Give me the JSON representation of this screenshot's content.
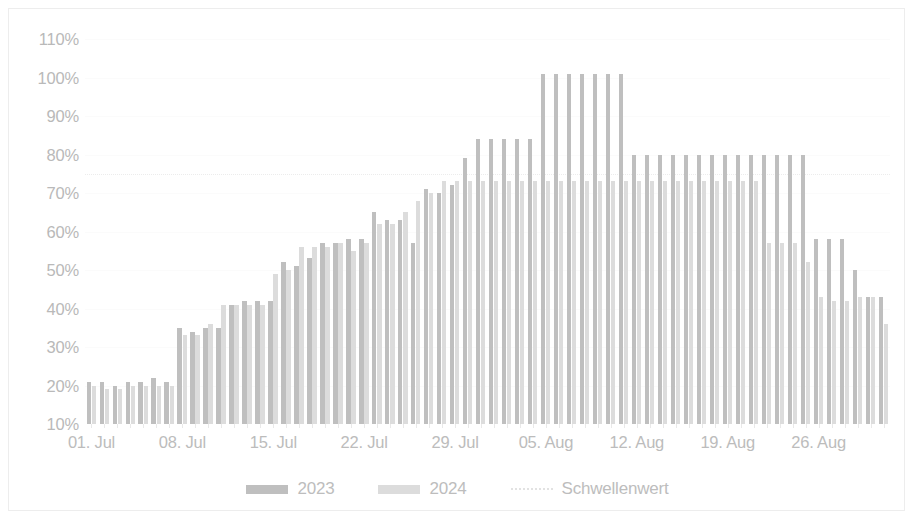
{
  "chart_data": {
    "type": "bar",
    "title": "",
    "subtitle": "",
    "xlabel": "",
    "ylabel": "",
    "ylim": [
      10,
      110
    ],
    "ytick_labels": [
      "110%",
      "100%",
      "90%",
      "80%",
      "70%",
      "60%",
      "50%",
      "40%",
      "30%",
      "20%",
      "10%"
    ],
    "ytick_values": [
      110,
      100,
      90,
      80,
      70,
      60,
      50,
      40,
      30,
      20,
      10
    ],
    "xtick_labels": [
      "01. Jul",
      "08. Jul",
      "15. Jul",
      "22. Jul",
      "29. Jul",
      "05. Aug",
      "12. Aug",
      "19. Aug",
      "26. Aug"
    ],
    "xtick_indices": [
      0,
      7,
      14,
      21,
      28,
      35,
      42,
      49,
      56
    ],
    "grid": true,
    "legend_position": "bottom",
    "x": [
      "01. Jul",
      "02. Jul",
      "03. Jul",
      "04. Jul",
      "05. Jul",
      "06. Jul",
      "07. Jul",
      "08. Jul",
      "09. Jul",
      "10. Jul",
      "11. Jul",
      "12. Jul",
      "13. Jul",
      "14. Jul",
      "15. Jul",
      "16. Jul",
      "17. Jul",
      "18. Jul",
      "19. Jul",
      "20. Jul",
      "21. Jul",
      "22. Jul",
      "23. Jul",
      "24. Jul",
      "25. Jul",
      "26. Jul",
      "27. Jul",
      "28. Jul",
      "29. Jul",
      "30. Jul",
      "31. Jul",
      "01. Aug",
      "02. Aug",
      "03. Aug",
      "04. Aug",
      "05. Aug",
      "06. Aug",
      "07. Aug",
      "08. Aug",
      "09. Aug",
      "10. Aug",
      "11. Aug",
      "12. Aug",
      "13. Aug",
      "14. Aug",
      "15. Aug",
      "16. Aug",
      "17. Aug",
      "18. Aug",
      "19. Aug",
      "20. Aug",
      "21. Aug",
      "22. Aug",
      "23. Aug",
      "24. Aug",
      "25. Aug",
      "26. Aug",
      "27. Aug",
      "28. Aug",
      "29. Aug",
      "30. Aug",
      "31. Aug"
    ],
    "series": [
      {
        "name": "2023",
        "color": "#bfbfbf",
        "values": [
          21,
          21,
          20,
          21,
          21,
          22,
          21,
          35,
          34,
          35,
          35,
          41,
          42,
          42,
          42,
          52,
          51,
          53,
          57,
          57,
          58,
          58,
          65,
          63,
          63,
          57,
          71,
          70,
          72,
          79,
          84,
          84,
          84,
          84,
          84,
          101,
          101,
          101,
          101,
          101,
          101,
          101,
          80,
          80,
          80,
          80,
          80,
          80,
          80,
          80,
          80,
          80,
          80,
          80,
          80,
          80,
          58,
          58,
          58,
          50,
          43,
          43
        ]
      },
      {
        "name": "2024",
        "color": "#dcdcdc",
        "values": [
          20,
          19,
          19,
          20,
          20,
          20,
          20,
          33,
          33,
          36,
          41,
          41,
          41,
          41,
          49,
          50,
          56,
          56,
          56,
          57,
          55,
          57,
          62,
          62,
          65,
          68,
          70,
          73,
          73,
          73,
          73,
          73,
          73,
          73,
          73,
          73,
          73,
          73,
          73,
          73,
          73,
          73,
          73,
          73,
          73,
          73,
          73,
          73,
          73,
          73,
          73,
          73,
          57,
          57,
          57,
          52,
          43,
          42,
          42,
          43,
          43,
          36
        ]
      }
    ],
    "threshold": {
      "name": "Schwellenwert",
      "value": 75,
      "color": "#ececec",
      "style": "dotted"
    }
  },
  "legend": {
    "items": [
      {
        "label": "2023",
        "marker": "bar-swatch",
        "color": "#bfbfbf"
      },
      {
        "label": "2024",
        "marker": "bar-swatch",
        "color": "#dcdcdc"
      },
      {
        "label": "Schwellenwert",
        "marker": "dotted-line",
        "color": "#e2e2e2"
      }
    ]
  }
}
